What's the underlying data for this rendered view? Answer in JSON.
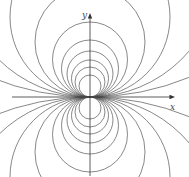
{
  "diagram": {
    "axes": {
      "x_label": "x",
      "y_label": "y",
      "origin": [
        90,
        97
      ],
      "color": "#333333"
    },
    "curve_color": "#555555",
    "circle_radii": [
      11,
      15,
      18.5,
      23,
      28.5,
      37.5,
      55,
      80,
      130,
      260
    ]
  }
}
